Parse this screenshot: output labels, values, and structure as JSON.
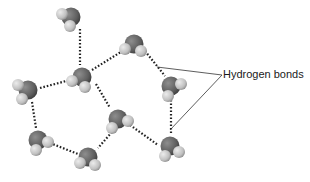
{
  "diagram": {
    "label": "Hydrogen bonds",
    "label_pos": {
      "x": 223,
      "y": 68
    },
    "pointer_origin": {
      "x": 222,
      "y": 75
    },
    "pointer_targets": [
      {
        "x": 157,
        "y": 67
      },
      {
        "x": 170,
        "y": 130
      }
    ],
    "colors": {
      "oxygen": "#6e6e6e",
      "oxygen_dark": "#4a4a4a",
      "hydrogen": "#cfcfcf",
      "hydrogen_dark": "#9a9a9a",
      "bond": "#222222",
      "pointer": "#333333"
    },
    "molecules": [
      {
        "id": "m1",
        "x": 71,
        "y": 17,
        "h1": [
          -9,
          -3
        ],
        "h2": [
          -1,
          9
        ]
      },
      {
        "id": "m2",
        "x": 82,
        "y": 77,
        "h1": [
          -10,
          4
        ],
        "h2": [
          3,
          10
        ]
      },
      {
        "id": "m3",
        "x": 28,
        "y": 90,
        "h1": [
          -10,
          -5
        ],
        "h2": [
          -6,
          9
        ]
      },
      {
        "id": "m4",
        "x": 134,
        "y": 44,
        "h1": [
          -9,
          5
        ],
        "h2": [
          7,
          7
        ]
      },
      {
        "id": "m5",
        "x": 171,
        "y": 86,
        "h1": [
          10,
          -2
        ],
        "h2": [
          -3,
          10
        ]
      },
      {
        "id": "m6",
        "x": 118,
        "y": 119,
        "h1": [
          10,
          2
        ],
        "h2": [
          -6,
          9
        ]
      },
      {
        "id": "m7",
        "x": 170,
        "y": 146,
        "h1": [
          9,
          6
        ],
        "h2": [
          -5,
          10
        ]
      },
      {
        "id": "m8",
        "x": 88,
        "y": 157,
        "h1": [
          -8,
          6
        ],
        "h2": [
          7,
          8
        ]
      },
      {
        "id": "m9",
        "x": 38,
        "y": 140,
        "h1": [
          10,
          2
        ],
        "h2": [
          -2,
          10
        ]
      }
    ],
    "bonds": [
      {
        "from": [
          80,
          29
        ],
        "to": [
          80,
          65
        ]
      },
      {
        "from": [
          92,
          70
        ],
        "to": [
          124,
          50
        ]
      },
      {
        "from": [
          40,
          88
        ],
        "to": [
          70,
          80
        ]
      },
      {
        "from": [
          145,
          51
        ],
        "to": [
          165,
          76
        ]
      },
      {
        "from": [
          96,
          84
        ],
        "to": [
          110,
          108
        ]
      },
      {
        "from": [
          171,
          100
        ],
        "to": [
          171,
          135
        ]
      },
      {
        "from": [
          130,
          125
        ],
        "to": [
          158,
          145
        ]
      },
      {
        "from": [
          32,
          102
        ],
        "to": [
          36,
          128
        ]
      },
      {
        "from": [
          50,
          143
        ],
        "to": [
          78,
          154
        ]
      },
      {
        "from": [
          112,
          132
        ],
        "to": [
          98,
          148
        ]
      }
    ]
  }
}
